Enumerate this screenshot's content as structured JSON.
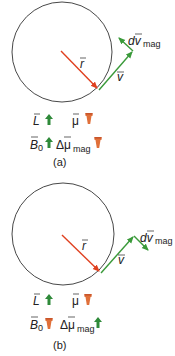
{
  "colors": {
    "circle": "#333333",
    "r_vector": "#e0401f",
    "v_vector": "#3a9a3a",
    "up_icon": "#2f8a3a",
    "down_icon": "#e0703a"
  },
  "panels": [
    {
      "caption": "(a)",
      "labels": {
        "r": "r",
        "v": "v",
        "dv": "dv",
        "dv_sub": "mag",
        "L": "L",
        "mu": "μ",
        "B": "B",
        "B_sub": "0",
        "dmu": "Δμ",
        "dmu_sub": "mag"
      },
      "icons": {
        "L": "up-arrow-icon",
        "mu": "down-arrow-icon",
        "B": "up-arrow-icon",
        "dmu": "down-arrow-icon"
      }
    },
    {
      "caption": "(b)",
      "labels": {
        "r": "r",
        "v": "v",
        "dv": "dv",
        "dv_sub": "mag",
        "L": "L",
        "mu": "μ",
        "B": "B",
        "B_sub": "0",
        "dmu": "Δμ",
        "dmu_sub": "mag"
      },
      "icons": {
        "L": "up-arrow-icon",
        "mu": "down-arrow-icon",
        "B": "down-arrow-icon",
        "dmu": "up-arrow-icon"
      }
    }
  ]
}
